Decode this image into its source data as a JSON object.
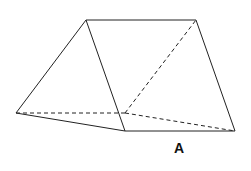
{
  "diagram": {
    "type": "triangular-prism",
    "label": "A",
    "line_color": "#222222",
    "vertices": {
      "left": [
        16,
        113
      ],
      "apex_front": [
        86,
        20
      ],
      "apex_back": [
        196,
        20
      ],
      "bottom_front": [
        125,
        131
      ],
      "bottom_back_right": [
        235,
        131
      ],
      "hidden_back": [
        125,
        113
      ]
    },
    "edges_solid": [
      [
        "left",
        "apex_front"
      ],
      [
        "apex_front",
        "apex_back"
      ],
      [
        "apex_front",
        "bottom_front"
      ],
      [
        "left",
        "bottom_front"
      ],
      [
        "bottom_front",
        "bottom_back_right"
      ],
      [
        "apex_back",
        "bottom_back_right"
      ]
    ],
    "edges_dashed": [
      [
        "left",
        "hidden_back"
      ],
      [
        "hidden_back",
        "apex_back"
      ],
      [
        "hidden_back",
        "bottom_back_right"
      ]
    ]
  }
}
